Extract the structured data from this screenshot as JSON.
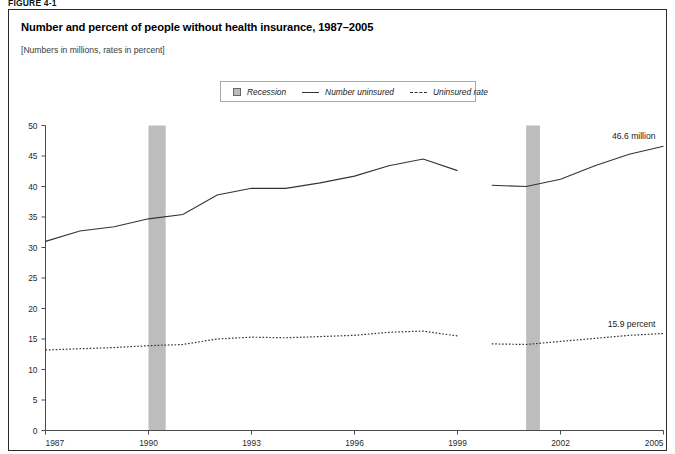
{
  "figure": {
    "tag": "FIGURE 4-1"
  },
  "header": {
    "title": "Number and percent of people without health insurance, 1987–2005",
    "subtitle": "[Numbers in millions, rates in percent]"
  },
  "legend": {
    "position": "top-center",
    "items": [
      {
        "label": "Recession",
        "marker": "recession-swatch",
        "color": "#bdbdbd"
      },
      {
        "label": "Number uninsured",
        "marker": "solid-line",
        "color": "#333333"
      },
      {
        "label": "Uninsured rate",
        "marker": "dashed-line",
        "color": "#333333"
      }
    ]
  },
  "annotations": [
    {
      "name": "number-uninsured-endpoint",
      "text": "46.6 million",
      "x": 2005,
      "y": 46.6
    },
    {
      "name": "uninsured-rate-endpoint",
      "text": "15.9 percent",
      "x": 2005,
      "y": 15.9
    }
  ],
  "chart_data": {
    "type": "line",
    "title": "Number and percent of people without health insurance, 1987–2005",
    "subtitle": "[Numbers in millions, rates in percent]",
    "xlabel": "",
    "ylabel": "",
    "xlim": [
      1987,
      2005
    ],
    "ylim": [
      0,
      50
    ],
    "ytick_step": 5,
    "yticks": [
      0,
      5,
      10,
      15,
      20,
      25,
      30,
      35,
      40,
      45,
      50
    ],
    "xticks": [
      1987,
      1990,
      1993,
      1996,
      1999,
      2002,
      2005
    ],
    "xtick_labels": [
      "1987",
      "1990",
      "1993",
      "1996",
      "1999",
      "2002",
      "2005"
    ],
    "grid": false,
    "legend_position": "top-center",
    "x": [
      1987,
      1988,
      1989,
      1990,
      1991,
      1992,
      1993,
      1994,
      1995,
      1996,
      1997,
      1998,
      1999,
      2000,
      2001,
      2002,
      2003,
      2004,
      2005
    ],
    "series": [
      {
        "name": "Number uninsured",
        "style": "solid",
        "color": "#333333",
        "unit": "millions",
        "values": [
          31.0,
          32.7,
          33.4,
          34.7,
          35.4,
          38.6,
          39.7,
          39.7,
          40.6,
          41.7,
          43.4,
          44.5,
          42.6,
          40.2,
          40.0,
          41.2,
          43.4,
          45.3,
          46.6
        ],
        "break_after_year": 1999,
        "break_values": {
          "1999_old_series": 42.6,
          "2000_new_series": 40.2
        }
      },
      {
        "name": "Uninsured rate",
        "style": "dashed",
        "color": "#333333",
        "unit": "percent",
        "values": [
          13.2,
          13.4,
          13.6,
          13.9,
          14.1,
          15.0,
          15.3,
          15.2,
          15.4,
          15.6,
          16.1,
          16.3,
          15.5,
          14.2,
          14.1,
          14.6,
          15.1,
          15.6,
          15.9
        ],
        "break_after_year": 1999,
        "break_values": {
          "1999_old_series": 15.5,
          "2000_new_series": 14.2
        }
      }
    ],
    "shaded_regions": [
      {
        "name": "recession-1990",
        "label": "Recession",
        "x_start": 1990.0,
        "x_end": 1990.5,
        "color": "#bdbdbd"
      },
      {
        "name": "recession-2001",
        "label": "Recession",
        "x_start": 2001.0,
        "x_end": 2001.4,
        "color": "#bdbdbd"
      }
    ]
  }
}
